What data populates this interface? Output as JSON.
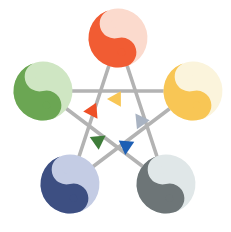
{
  "diagram": {
    "title": "Wu Xing Five Elements Cycle",
    "background_color": "#ffffff",
    "width": 231,
    "height": 232,
    "center": {
      "x": 118,
      "y": 112
    },
    "line_color": "#b3b3b3",
    "line_width": 3.6,
    "circle_radius": 29.5
  },
  "nodes": [
    {
      "id": "fire",
      "label": "Fire",
      "position": "top",
      "cx": 118,
      "cy": 38,
      "r": 29.5,
      "dark_color": "#f15c33",
      "light_color": "#fbdacd",
      "rotation": -14
    },
    {
      "id": "wood",
      "label": "Wood",
      "position": "left",
      "cx": 43,
      "cy": 91,
      "r": 29.5,
      "dark_color": "#6ba653",
      "light_color": "#cfe6c3",
      "rotation": -14
    },
    {
      "id": "metal",
      "label": "Metal",
      "position": "right",
      "cx": 193,
      "cy": 91,
      "r": 29.5,
      "dark_color": "#f8c655",
      "light_color": "#fbf4dc",
      "rotation": -14
    },
    {
      "id": "water",
      "label": "Water",
      "position": "bottom-left",
      "cx": 70,
      "cy": 184,
      "r": 29.5,
      "dark_color": "#3d4f82",
      "light_color": "#c4cce4",
      "rotation": -14
    },
    {
      "id": "earth",
      "label": "Earth",
      "position": "bottom-right",
      "cx": 166,
      "cy": 184,
      "r": 29.5,
      "dark_color": "#6d7577",
      "light_color": "#e0e7e8",
      "rotation": -14
    }
  ],
  "links": [
    {
      "id": "fire-to-water",
      "from": "fire",
      "to": "water",
      "color": "#b3b3b3"
    },
    {
      "id": "fire-to-earth",
      "from": "fire",
      "to": "earth",
      "color": "#b3b3b3"
    },
    {
      "id": "wood-to-metal",
      "from": "wood",
      "to": "metal",
      "color": "#b3b3b3"
    },
    {
      "id": "wood-to-earth",
      "from": "wood",
      "to": "earth",
      "color": "#b3b3b3"
    },
    {
      "id": "metal-to-water",
      "from": "metal",
      "to": "water",
      "color": "#b3b3b3"
    }
  ],
  "arrows": [
    {
      "id": "arrow-yellow",
      "color": "#f8c655",
      "x": 115,
      "y": 99,
      "angle": 180,
      "size": 13,
      "note": "points left along metal-to-wood line"
    },
    {
      "id": "arrow-red",
      "color": "#ee4f26",
      "x": 93,
      "y": 112,
      "angle": 56,
      "size": 13,
      "note": "points down-right along fire-to-water line"
    },
    {
      "id": "arrow-gray",
      "color": "#a9b3c2",
      "x": 140,
      "y": 120,
      "angle": -125,
      "size": 13,
      "note": "points up-left along earth-to-fire line"
    },
    {
      "id": "arrow-green",
      "color": "#3f7d3a",
      "x": 99,
      "y": 140,
      "angle": -35,
      "size": 13,
      "note": "points up-right along water-to-wood line"
    },
    {
      "id": "arrow-blue",
      "color": "#1d5fb4",
      "x": 126,
      "y": 147,
      "angle": 95,
      "size": 13,
      "note": "points down along wood-to-earth line"
    }
  ]
}
